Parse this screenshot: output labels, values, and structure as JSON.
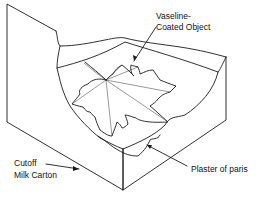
{
  "diagram": {
    "type": "illustration",
    "labels": {
      "object": {
        "line1": "Vaseline-",
        "line2": "Coated Object"
      },
      "plaster": "Plaster of paris",
      "carton": {
        "line1": "Cutoff",
        "line2": "Milk Carton"
      }
    },
    "colors": {
      "line": "#1a1a1a",
      "background": "#ffffff"
    }
  }
}
